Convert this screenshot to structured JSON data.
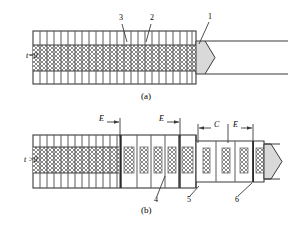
{
  "figure": {
    "type": "technical-diagram",
    "background": "#ffffff",
    "line_color": "#3a3a3a",
    "hatch_color": "#7d7d7d",
    "wedge_fill": "#d9d9d9",
    "dark_band_color": "#2b2b2b"
  },
  "panels": [
    {
      "id": "panel-a",
      "caption": "(a)",
      "time_label": "t=0",
      "callouts": [
        {
          "id": "callout-3",
          "text": "3"
        },
        {
          "id": "callout-2",
          "text": "2"
        },
        {
          "id": "callout-1",
          "text": "1"
        }
      ]
    },
    {
      "id": "panel-b",
      "caption": "(b)",
      "time_label": "t >0",
      "callouts": [
        {
          "id": "callout-4",
          "text": "4"
        },
        {
          "id": "callout-5",
          "text": "5"
        },
        {
          "id": "callout-6",
          "text": "6"
        }
      ],
      "dimensions": [
        {
          "id": "dim-E-1",
          "text": "E"
        },
        {
          "id": "dim-E-2",
          "text": "E"
        },
        {
          "id": "dim-C",
          "text": "C"
        },
        {
          "id": "dim-E-3",
          "text": "E"
        }
      ]
    }
  ],
  "geometry": {
    "panel_a": {
      "x": 33,
      "y": 31,
      "w": 163,
      "h": 53,
      "band_top": 45,
      "band_bottom": 71,
      "grid_count": 24,
      "wedge_tip_x": 215
    },
    "panel_b": {
      "x": 33,
      "y": 135,
      "w": 163,
      "h": 53,
      "band_top": 147,
      "band_bottom": 173,
      "narrow_x": 196,
      "narrow_y": 141,
      "narrow_w": 68,
      "narrow_h": 41,
      "wedge_tip_x": 282
    }
  },
  "text": {
    "t_zero": "t=0",
    "t_gt_zero": "t >0",
    "caption_a": "(a)",
    "caption_b": "(b)",
    "n1": "1",
    "n2": "2",
    "n3": "3",
    "n4": "4",
    "n5": "5",
    "n6": "6",
    "E1": "E",
    "E2": "E",
    "E3": "E",
    "C": "C"
  }
}
